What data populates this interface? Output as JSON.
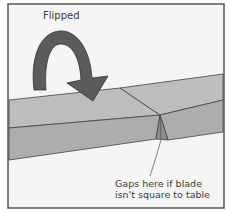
{
  "diagram": {
    "title_label": "Flipped",
    "callout": {
      "line1": "Gaps here if blade",
      "line2": "isn't square to table"
    },
    "colors": {
      "background": "#f4f4f4",
      "frame": "#555555",
      "board_top": "#b8b8b8",
      "board_front": "#a9a9a9",
      "edge_lines": "#444444",
      "arrow": "#5a5a5a"
    },
    "elements": [
      "frame-border",
      "flip-arrow",
      "board-left-piece",
      "board-right-piece",
      "miter-gap",
      "callout-leader-line"
    ]
  }
}
